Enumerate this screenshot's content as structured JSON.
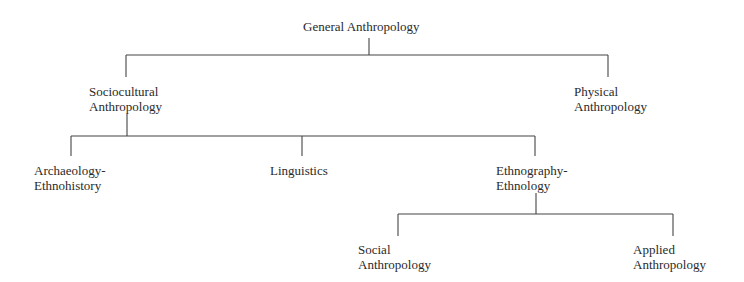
{
  "diagram": {
    "type": "tree",
    "root": "General Anthropology",
    "nodes": [
      {
        "id": "general",
        "lines": [
          "General Anthropology"
        ]
      },
      {
        "id": "sociocultural",
        "lines": [
          "Sociocultural",
          "Anthropology"
        ],
        "parent": "general"
      },
      {
        "id": "physical",
        "lines": [
          "Physical",
          "Anthropology"
        ],
        "parent": "general"
      },
      {
        "id": "archaeology",
        "lines": [
          "Archaeology-",
          "Ethnohistory"
        ],
        "parent": "sociocultural"
      },
      {
        "id": "linguistics",
        "lines": [
          "Linguistics"
        ],
        "parent": "sociocultural"
      },
      {
        "id": "ethnography",
        "lines": [
          "Ethnography-",
          "Ethnology"
        ],
        "parent": "sociocultural"
      },
      {
        "id": "social",
        "lines": [
          "Social",
          "Anthropology"
        ],
        "parent": "ethnography"
      },
      {
        "id": "applied",
        "lines": [
          "Applied",
          "Anthropology"
        ],
        "parent": "ethnography"
      }
    ]
  },
  "labels": {
    "general": "General Anthropology",
    "sociocultural_1": "Sociocultural",
    "sociocultural_2": "Anthropology",
    "physical_1": "Physical",
    "physical_2": "Anthropology",
    "archaeology_1": "Archaeology-",
    "archaeology_2": "Ethnohistory",
    "linguistics": "Linguistics",
    "ethnography_1": "Ethnography-",
    "ethnography_2": "Ethnology",
    "social_1": "Social",
    "social_2": "Anthropology",
    "applied_1": "Applied",
    "applied_2": "Anthropology"
  }
}
